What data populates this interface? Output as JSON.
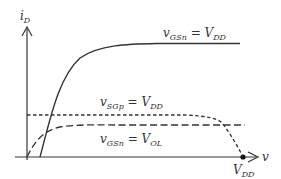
{
  "diagram": {
    "axes": {
      "y_label": "i",
      "y_label_sub": "D",
      "x_label": "v",
      "x_marker_label": "V",
      "x_marker_sub": "DD"
    },
    "curves": [
      {
        "name": "vGSn-VDD",
        "style": "solid",
        "label_var": "v",
        "label_var_sub": "GSn",
        "label_eq": " = ",
        "label_val": "V",
        "label_val_sub": "DD"
      },
      {
        "name": "vSGp-VDD",
        "style": "short-dash",
        "label_var": "v",
        "label_var_sub": "SGp",
        "label_eq": " = ",
        "label_val": "V",
        "label_val_sub": "DD"
      },
      {
        "name": "vGSn-VOL",
        "style": "long-dash",
        "label_var": "v",
        "label_var_sub": "GSn",
        "label_eq": " = ",
        "label_val": "V",
        "label_val_sub": "OL"
      }
    ],
    "colors": {
      "line": "#333333",
      "background": "#ffffff"
    }
  }
}
